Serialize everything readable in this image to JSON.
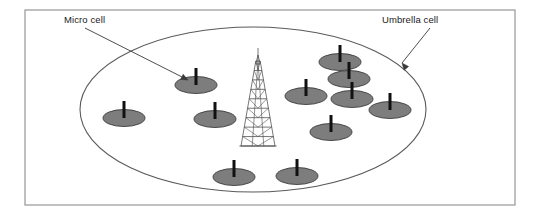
{
  "figure": {
    "type": "network-topology-diagram"
  },
  "labels": {
    "micro_cell": "Micro cell",
    "umbrella_cell": "Umbrella cell"
  },
  "frame": {
    "x": 25,
    "y": 10,
    "width": 490,
    "height": 195,
    "stroke": "#8c8c8c",
    "fill": "#ffffff",
    "stroke_width": 1.1
  },
  "umbrella_cell": {
    "name": "umbrella-cell-boundary",
    "cx": 253,
    "cy": 109.5,
    "rx": 173,
    "ry": 82.5,
    "stroke": "#5a5a5a",
    "fill": "none",
    "stroke_width": 1.1
  },
  "tower": {
    "name": "macro-cell-tower",
    "apex_x": 258,
    "apex_y": 57,
    "base_y": 146,
    "base_half_width": 17,
    "stroke": "#4a4a4a",
    "stroke_width": 0.75,
    "rungs": 9
  },
  "micro_cells": {
    "fill": "#7d7d7d",
    "stroke": "#3c3c3c",
    "mast_color": "#111111",
    "rx": 21,
    "ry": 8.5,
    "mast_height": 17,
    "items": [
      {
        "id": "micro-cell-1",
        "cx": 196,
        "cy": 85
      },
      {
        "id": "micro-cell-2",
        "cx": 124,
        "cy": 118
      },
      {
        "id": "micro-cell-3",
        "cx": 215,
        "cy": 119
      },
      {
        "id": "micro-cell-4",
        "cx": 234,
        "cy": 177
      },
      {
        "id": "micro-cell-5",
        "cx": 297,
        "cy": 176
      },
      {
        "id": "micro-cell-6",
        "cx": 340,
        "cy": 62
      },
      {
        "id": "micro-cell-7",
        "cx": 349,
        "cy": 79
      },
      {
        "id": "micro-cell-8",
        "cx": 306,
        "cy": 96
      },
      {
        "id": "micro-cell-9",
        "cx": 352,
        "cy": 99
      },
      {
        "id": "micro-cell-10",
        "cx": 331,
        "cy": 132
      },
      {
        "id": "micro-cell-11",
        "cx": 390,
        "cy": 110
      }
    ]
  },
  "leaders": {
    "stroke": "#3a3a3a",
    "stroke_width": 0.9,
    "micro": {
      "name": "micro-cell-leader",
      "x1": 85,
      "y1": 28,
      "x2": 188,
      "y2": 80,
      "arrow_angle_deg": 27
    },
    "umbrella": {
      "name": "umbrella-cell-leader",
      "x1": 430,
      "y1": 28,
      "x2": 402,
      "y2": 63,
      "arrow_angle_deg": 231
    }
  }
}
